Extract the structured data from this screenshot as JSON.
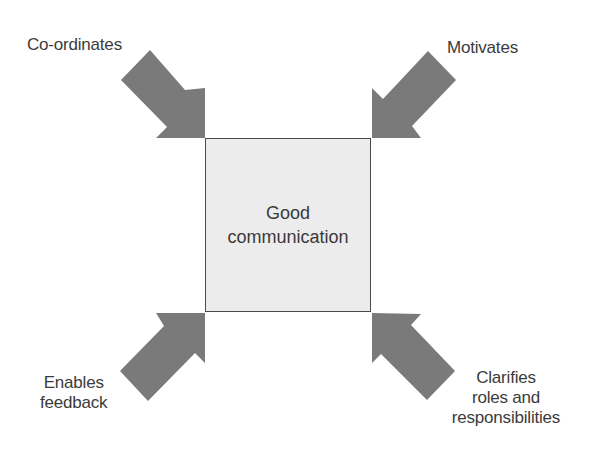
{
  "diagram": {
    "center": {
      "line1": "Good",
      "line2": "communication"
    },
    "arrows": [
      {
        "id": "top-left",
        "direction": "down-right",
        "label_lines": [
          "Co-ordinates"
        ]
      },
      {
        "id": "top-right",
        "direction": "down-left",
        "label_lines": [
          "Motivates"
        ]
      },
      {
        "id": "bottom-left",
        "direction": "up-right",
        "label_lines": [
          "Enables",
          "feedback"
        ]
      },
      {
        "id": "bottom-right",
        "direction": "up-left",
        "label_lines": [
          "Clarifies",
          "roles and",
          "responsibilities"
        ]
      }
    ],
    "colors": {
      "arrow_fill": "#7a7a7a",
      "box_fill": "#ececec",
      "box_border": "#4a4a4a",
      "text": "#3a3a3a"
    }
  }
}
